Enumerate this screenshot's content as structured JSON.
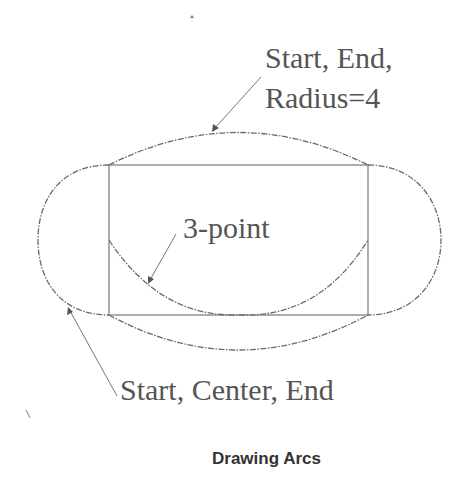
{
  "diagram": {
    "title": "Drawing Arcs",
    "labels": {
      "top_line1": "Start, End,",
      "top_line2": "Radius=4",
      "middle": "3-point",
      "bottom": "Start, Center, End"
    },
    "arc_types": [
      "Start, End, Radius",
      "3-point",
      "Start, Center, End"
    ],
    "radius_value": "4",
    "colors": {
      "line": "#6a6a6a",
      "text": "#555555",
      "caption": "#333333",
      "background": "#ffffff"
    }
  }
}
